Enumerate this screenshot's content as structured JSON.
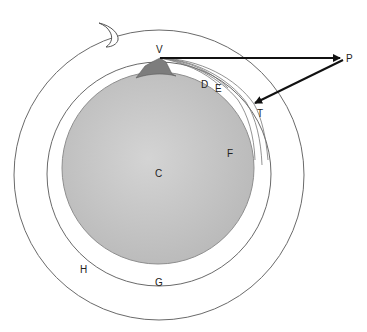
{
  "diagram": {
    "type": "geometric-figure",
    "colors": {
      "background": "#ffffff",
      "sphere_fill": "#c8c8c8",
      "sphere_edge": "#9a9a9a",
      "mountain": "#7d7d7d",
      "ring_stroke": "#6a6a6a",
      "arrow": "#111111"
    },
    "labels": {
      "V": "V",
      "P": "P",
      "D": "D",
      "E": "E",
      "F": "F",
      "T": "T",
      "C": "C",
      "G": "G",
      "H": "H"
    },
    "shapes": {
      "sphere": {
        "cx": 158,
        "cy": 168,
        "r": 96
      },
      "middle_ring": {
        "cx": 159,
        "cy": 174,
        "r": 112
      },
      "outer_ring": {
        "cx": 159,
        "cy": 175,
        "r": 145
      },
      "crescent": {
        "x": 97,
        "y": 22,
        "w": 23,
        "h": 25
      }
    },
    "points": {
      "V": [
        160,
        58
      ],
      "P": [
        343,
        58
      ],
      "T": [
        253,
        103
      ]
    }
  }
}
